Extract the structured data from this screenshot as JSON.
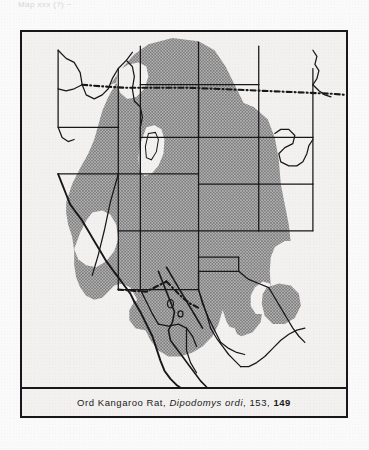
{
  "page": {
    "running_head": "Map  xxx (?)                                  ~"
  },
  "figure": {
    "caption": {
      "common_name": "Ord Kangaroo Rat,",
      "scientific_name": "Dipodomys ordi",
      "separator_1": ",",
      "page_ref_plain": "153,",
      "page_ref_bold": "149"
    },
    "colors": {
      "ink": "#19171a",
      "paper": "#f3f1ef",
      "range_fill": "#9a9a9a",
      "range_stipple": "#6f6f6f"
    }
  },
  "map": {
    "title": "Distribution range map of the Ord Kangaroo Rat",
    "projection_region": "Western North America",
    "legend": {
      "shaded_meaning": "Species distribution range",
      "unshaded_meaning": "Outside range",
      "dashed_line_meaning": "International boundary",
      "solid_line_meaning": "State / provincial boundary"
    },
    "features": [
      {
        "name": "canada-usa-border",
        "style": "dash-dot"
      },
      {
        "name": "usa-mexico-border",
        "style": "dash-dot"
      },
      {
        "name": "pacific-coastline",
        "style": "solid"
      },
      {
        "name": "baja-california-peninsula",
        "style": "solid"
      },
      {
        "name": "gulf-of-california",
        "style": "solid"
      },
      {
        "name": "state-boundaries",
        "style": "solid"
      },
      {
        "name": "great-salt-lake-void",
        "style": "unshaded-inset"
      },
      {
        "name": "distribution-range",
        "style": "stippled-gray"
      }
    ]
  }
}
